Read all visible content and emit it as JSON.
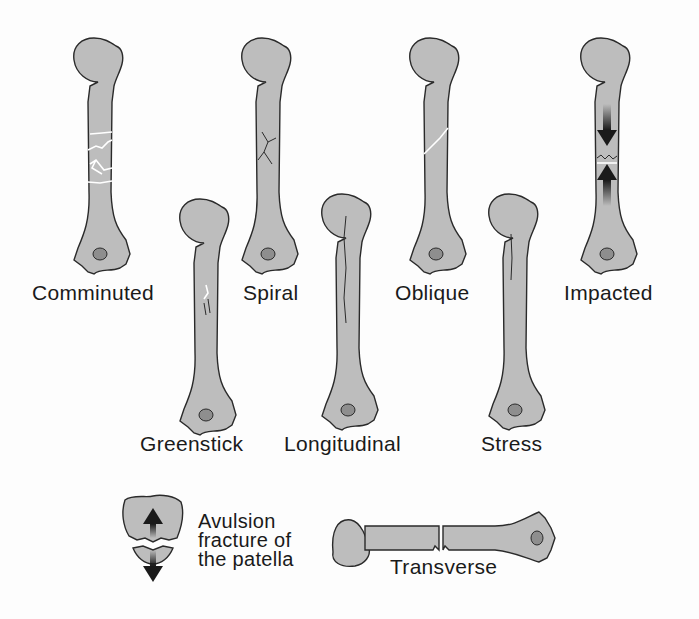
{
  "colors": {
    "bone_fill": "#bdbdbd",
    "outline": "#2a2a2a",
    "condyle_spot": "#8e8e8e",
    "arrow": "#1a1a1a",
    "background": "#fdfdfd"
  },
  "fractures": [
    {
      "id": "comminuted",
      "label": "Comminuted"
    },
    {
      "id": "spiral",
      "label": "Spiral"
    },
    {
      "id": "oblique",
      "label": "Oblique"
    },
    {
      "id": "impacted",
      "label": "Impacted"
    },
    {
      "id": "greenstick",
      "label": "Greenstick"
    },
    {
      "id": "longitudinal",
      "label": "Longitudinal"
    },
    {
      "id": "stress",
      "label": "Stress"
    },
    {
      "id": "avulsion",
      "label_lines": [
        "Avulsion",
        "fracture of",
        "the patella"
      ]
    },
    {
      "id": "transverse",
      "label": "Transverse"
    }
  ]
}
